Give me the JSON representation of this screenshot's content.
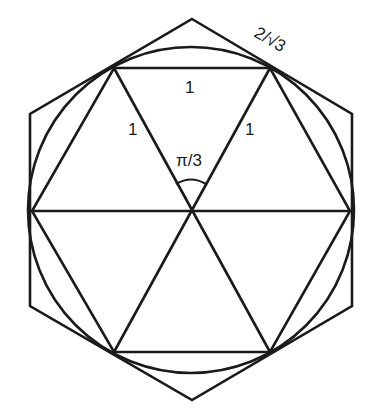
{
  "diagram": {
    "labels": {
      "top_side": "1",
      "left_side": "1",
      "right_side": "1",
      "angle": "π/3",
      "outer_side": "2/√3"
    },
    "colors": {
      "stroke": "#1a1a1a",
      "background": "#ffffff"
    }
  }
}
